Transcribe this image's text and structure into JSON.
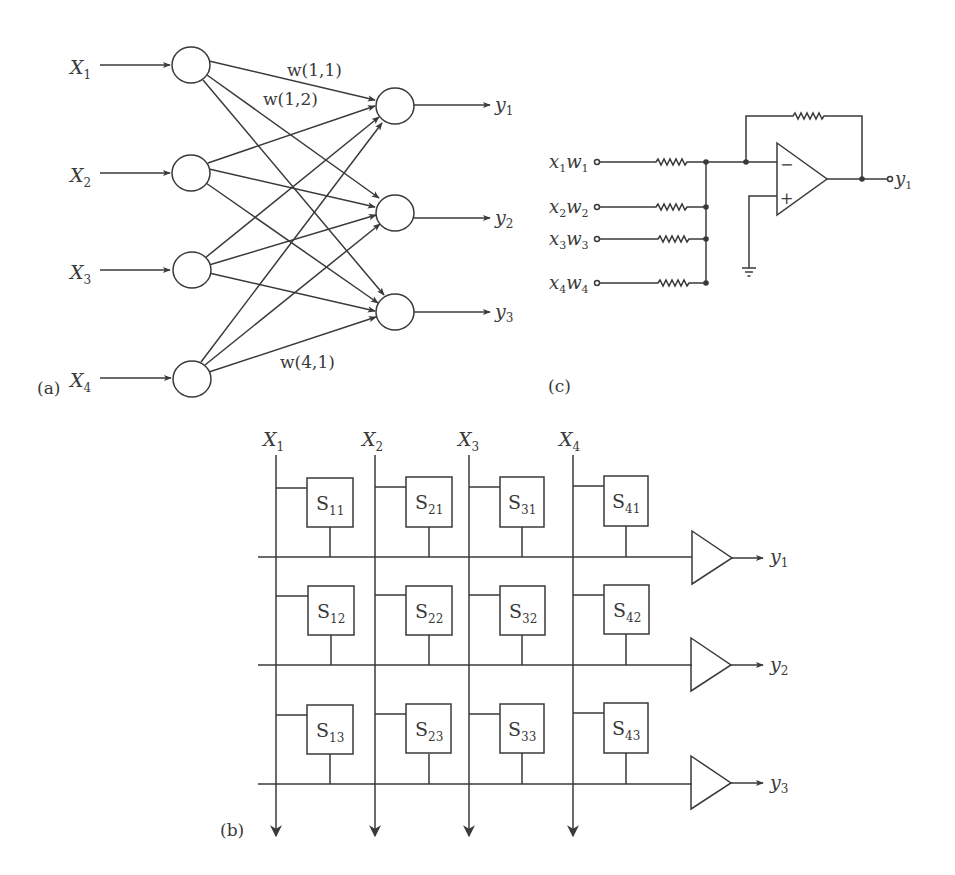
{
  "colors": {
    "ink": "#3a3a3a",
    "background": "#ffffff"
  },
  "panel_a": {
    "label": "(a)",
    "inputs": [
      {
        "base": "X",
        "sub": "1"
      },
      {
        "base": "X",
        "sub": "2"
      },
      {
        "base": "X",
        "sub": "3"
      },
      {
        "base": "X",
        "sub": "4"
      }
    ],
    "outputs": [
      {
        "base": "y",
        "sub": "1"
      },
      {
        "base": "y",
        "sub": "2"
      },
      {
        "base": "y",
        "sub": "3"
      }
    ],
    "weight_labels": [
      "w(1,1)",
      "w(1,2)",
      "w(4,1)"
    ]
  },
  "panel_b": {
    "label": "(b)",
    "columns": [
      {
        "base": "X",
        "sub": "1"
      },
      {
        "base": "X",
        "sub": "2"
      },
      {
        "base": "X",
        "sub": "3"
      },
      {
        "base": "X",
        "sub": "4"
      }
    ],
    "cells": [
      [
        {
          "base": "S",
          "sub": "11"
        },
        {
          "base": "S",
          "sub": "21"
        },
        {
          "base": "S",
          "sub": "31"
        },
        {
          "base": "S",
          "sub": "41"
        }
      ],
      [
        {
          "base": "S",
          "sub": "12"
        },
        {
          "base": "S",
          "sub": "22"
        },
        {
          "base": "S",
          "sub": "32"
        },
        {
          "base": "S",
          "sub": "42"
        }
      ],
      [
        {
          "base": "S",
          "sub": "13"
        },
        {
          "base": "S",
          "sub": "23"
        },
        {
          "base": "S",
          "sub": "33"
        },
        {
          "base": "S",
          "sub": "43"
        }
      ]
    ],
    "outputs": [
      {
        "base": "y",
        "sub": "1"
      },
      {
        "base": "y",
        "sub": "2"
      },
      {
        "base": "y",
        "sub": "3"
      }
    ]
  },
  "panel_c": {
    "label": "(c)",
    "inputs": [
      {
        "x": "x",
        "xs": "1",
        "w": "w",
        "ws": "1"
      },
      {
        "x": "x",
        "xs": "2",
        "w": "w",
        "ws": "2"
      },
      {
        "x": "x",
        "xs": "3",
        "w": "w",
        "ws": "3"
      },
      {
        "x": "x",
        "xs": "4",
        "w": "w",
        "ws": "4"
      }
    ],
    "minus_sign": "−",
    "plus_sign": "+",
    "output": {
      "base": "y",
      "sub": "1"
    }
  }
}
